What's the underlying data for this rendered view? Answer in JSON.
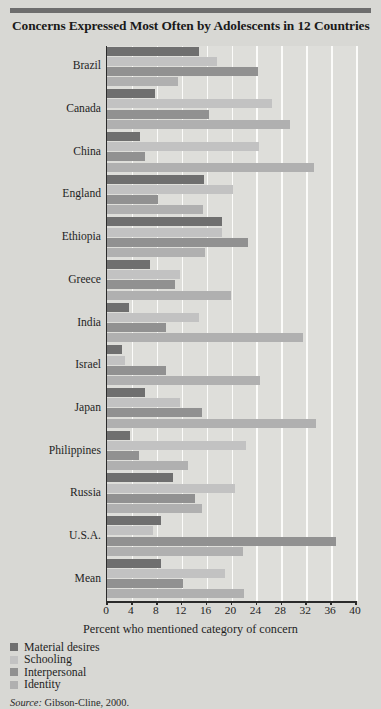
{
  "title": "Concerns Expressed Most Often by Adolescents in 12 Countries",
  "source": {
    "label": "Source:",
    "text": " Gibson-Cline, 2000."
  },
  "axis": {
    "x_title": "Percent who mentioned category of concern",
    "x_ticks": [
      "0",
      "4",
      "8",
      "12",
      "16",
      "20",
      "24",
      "28",
      "32",
      "36",
      "40"
    ]
  },
  "legend": {
    "items": [
      {
        "label": "Material desires",
        "color": "#6f6f6f"
      },
      {
        "label": "Schooling",
        "color": "#c2c2c2"
      },
      {
        "label": "Interpersonal",
        "color": "#919191"
      },
      {
        "label": "Identity",
        "color": "#b0b0b0"
      }
    ]
  },
  "chart_data": {
    "type": "bar",
    "orientation": "horizontal",
    "title": "Concerns Expressed Most Often by Adolescents in 12 Countries",
    "xlabel": "Percent who mentioned category of concern",
    "ylabel": "",
    "xlim": [
      0,
      40
    ],
    "xticks": [
      0,
      4,
      8,
      12,
      16,
      20,
      24,
      28,
      32,
      36,
      40
    ],
    "grid": true,
    "legend_position": "below-left",
    "categories": [
      "Brazil",
      "Canada",
      "China",
      "England",
      "Ethiopia",
      "Greece",
      "India",
      "Israel",
      "Japan",
      "Philippines",
      "Russia",
      "U.S.A.",
      "Mean"
    ],
    "series": [
      {
        "name": "Material desires",
        "color": "#6f6f6f",
        "values": [
          14.8,
          7.7,
          5.3,
          15.6,
          18.5,
          6.9,
          3.6,
          2.4,
          6.1,
          3.7,
          10.6,
          8.7,
          8.6
        ]
      },
      {
        "name": "Schooling",
        "color": "#c2c2c2",
        "values": [
          17.7,
          26.5,
          24.4,
          20.2,
          18.5,
          11.7,
          14.8,
          2.9,
          11.7,
          22.3,
          20.6,
          7.4,
          19.0
        ]
      },
      {
        "name": "Interpersonal",
        "color": "#919191",
        "values": [
          24.3,
          16.4,
          6.1,
          8.2,
          22.7,
          10.9,
          9.4,
          9.4,
          15.3,
          5.2,
          14.2,
          36.8,
          12.2
        ]
      },
      {
        "name": "Identity",
        "color": "#b0b0b0",
        "values": [
          11.4,
          29.4,
          33.3,
          15.4,
          15.8,
          19.9,
          31.5,
          24.6,
          33.6,
          13.0,
          15.3,
          21.8,
          22.0
        ]
      }
    ]
  }
}
